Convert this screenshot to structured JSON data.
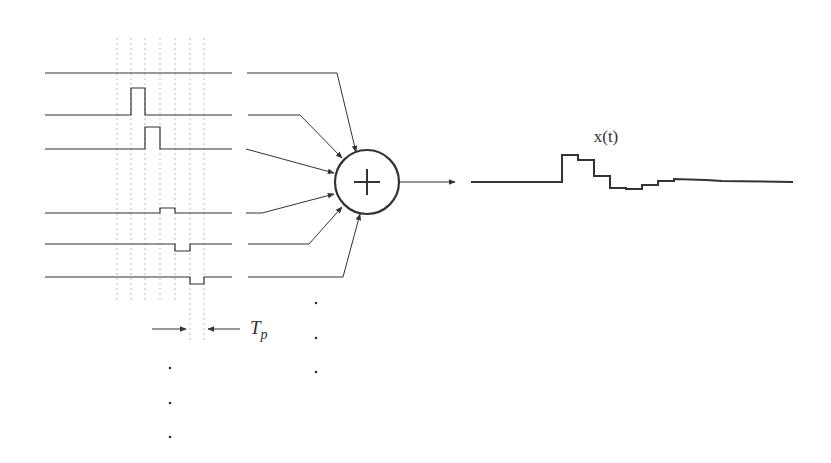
{
  "diagram": {
    "output_label": "x(t)",
    "period_label_main": "T",
    "period_label_sub": "p",
    "summer_symbol": "+",
    "colors": {
      "stroke": "#333333",
      "dotted": "#bbbbbb",
      "background": "#ffffff"
    },
    "grid_x": [
      117,
      131,
      145,
      160,
      175,
      190,
      204
    ],
    "input_rows": [
      {
        "y": 73,
        "pulse": null
      },
      {
        "y": 115,
        "pulse": {
          "x0": 131,
          "x1": 145,
          "height": 27
        }
      },
      {
        "y": 149,
        "pulse": {
          "x0": 145,
          "x1": 160,
          "height": 22
        }
      },
      {
        "y": 213,
        "pulse": {
          "x0": 160,
          "x1": 175,
          "height": 5
        }
      },
      {
        "y": 244,
        "pulse": {
          "x0": 175,
          "x1": 190,
          "height": -7
        }
      },
      {
        "y": 277,
        "pulse": {
          "x0": 190,
          "x1": 204,
          "height": -7
        }
      }
    ],
    "summer": {
      "cx": 367,
      "cy": 182,
      "r": 32
    },
    "ellipsis_dots": {
      "left": [
        [
          170,
          368
        ],
        [
          170,
          403
        ],
        [
          170,
          437
        ]
      ],
      "middle": [
        [
          316,
          303
        ],
        [
          316,
          338
        ],
        [
          316,
          372
        ]
      ]
    },
    "output_waveform": [
      [
        471,
        182
      ],
      [
        562,
        182
      ],
      [
        562,
        155
      ],
      [
        578,
        155
      ],
      [
        578,
        160
      ],
      [
        594,
        160
      ],
      [
        594,
        176
      ],
      [
        610,
        176
      ],
      [
        610,
        188
      ],
      [
        626,
        188
      ],
      [
        626,
        189
      ],
      [
        642,
        189
      ],
      [
        642,
        185
      ],
      [
        658,
        185
      ],
      [
        658,
        181
      ],
      [
        674,
        181
      ],
      [
        674,
        179
      ],
      [
        706,
        180
      ],
      [
        722,
        181
      ],
      [
        793,
        182
      ]
    ]
  }
}
